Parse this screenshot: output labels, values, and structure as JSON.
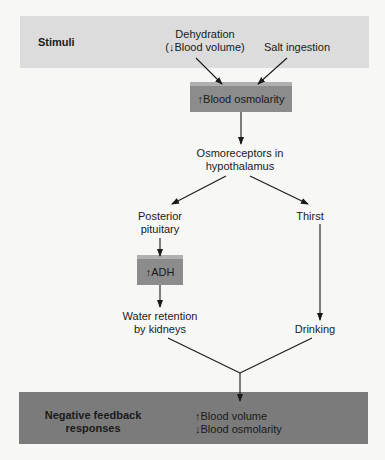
{
  "diagram": {
    "stimuli_band": {
      "title": "Stimuli",
      "items": [
        {
          "line1": "Dehydration",
          "line2": "(↓Blood volume)"
        },
        {
          "line1": "Salt ingestion"
        }
      ]
    },
    "blood_osmolarity_box": {
      "arrow": "↑",
      "label": "Blood osmolarity"
    },
    "osmoreceptors": {
      "line1": "Osmoreceptors in",
      "line2": "hypothalamus"
    },
    "posterior_pituitary": {
      "line1": "Posterior",
      "line2": "pituitary"
    },
    "thirst": {
      "label": "Thirst"
    },
    "adh_box": {
      "arrow": "↑",
      "label": "ADH"
    },
    "water_retention": {
      "line1": "Water retention",
      "line2": "by kidneys"
    },
    "drinking": {
      "label": "Drinking"
    },
    "response_band": {
      "title_line1": "Negative feedback",
      "title_line2": "responses",
      "result1": {
        "arrow": "↑",
        "label": "Blood volume"
      },
      "result2": {
        "arrow": "↓",
        "label": "Blood osmolarity"
      }
    },
    "colors": {
      "top_band": "#dcdcdc",
      "bottom_band": "#7b7b7b",
      "box": "#8c8c8c",
      "box_bevel": "#b0b0b0",
      "line": "#1a1a1a"
    }
  }
}
